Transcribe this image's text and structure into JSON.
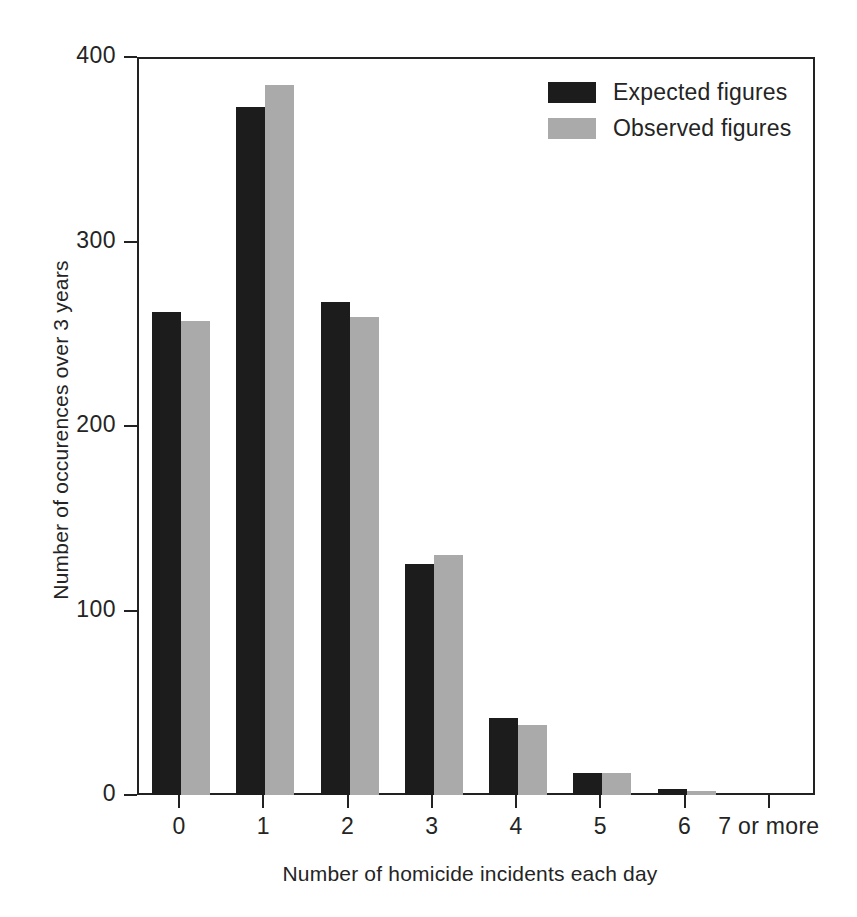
{
  "chart_data": {
    "type": "bar",
    "title": "",
    "xlabel": "Number of homicide incidents each day",
    "ylabel": "Number of occurences over 3 years",
    "categories": [
      "0",
      "1",
      "2",
      "3",
      "4",
      "5",
      "6",
      "7 or more"
    ],
    "series": [
      {
        "name": "Expected figures",
        "color": "#1c1c1c",
        "values": [
          262,
          373,
          267,
          125,
          42,
          12,
          3,
          0
        ]
      },
      {
        "name": "Observed figures",
        "color": "#aaaaaa",
        "values": [
          257,
          385,
          259,
          130,
          38,
          12,
          2,
          0
        ]
      }
    ],
    "ylim": [
      0,
      400
    ],
    "yticks": [
      0,
      100,
      200,
      300,
      400
    ],
    "ytick_labels": [
      "0",
      "100",
      "200",
      "300",
      "400"
    ],
    "grid": false,
    "legend_position": "top-right"
  },
  "legend": {
    "items": [
      {
        "label": "Expected figures"
      },
      {
        "label": "Observed figures"
      }
    ]
  }
}
